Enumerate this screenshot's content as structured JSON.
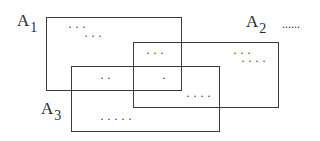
{
  "diagram": {
    "type": "overlapping-sets",
    "sets": [
      {
        "id": "A1",
        "letter": "A",
        "subscript": "1",
        "rect": {
          "x": 46,
          "y": 17,
          "w": 135,
          "h": 73
        }
      },
      {
        "id": "A2",
        "letter": "A",
        "subscript": "2",
        "rect": {
          "x": 133,
          "y": 42,
          "w": 145,
          "h": 65
        }
      },
      {
        "id": "A3",
        "letter": "A",
        "subscript": "3",
        "rect": {
          "x": 71,
          "y": 66,
          "w": 148,
          "h": 65
        }
      }
    ],
    "continuation": "......",
    "element_groups": [
      {
        "region": "A1 only (row 1)",
        "text": "···"
      },
      {
        "region": "A1 only (row 2)",
        "text": "···"
      },
      {
        "region": "A1 ∩ A2",
        "text": "···"
      },
      {
        "region": "A2 only (row 1)",
        "text": "···"
      },
      {
        "region": "A2 only (row 2)",
        "text": "····"
      },
      {
        "region": "A1 ∩ A3",
        "text": "··"
      },
      {
        "region": "A1 ∩ A2 ∩ A3",
        "text": "·"
      },
      {
        "region": "A2 ∩ A3",
        "text": "····"
      },
      {
        "region": "A3 only",
        "text": "·····"
      }
    ]
  }
}
